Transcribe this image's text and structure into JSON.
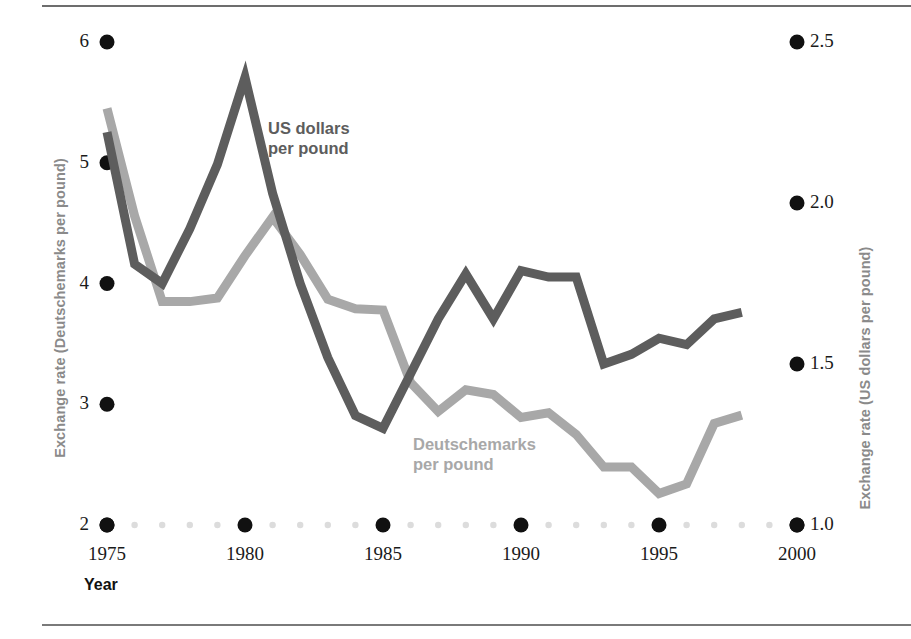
{
  "figure": {
    "background_color": "#ffffff",
    "rule_color": "#6d6d6d"
  },
  "axes": {
    "left": {
      "title": "Exchange rate (Deutschemarks per pound)",
      "ticks": [
        "6",
        "5",
        "4",
        "3",
        "2"
      ],
      "tick_values": [
        6,
        5,
        4,
        3,
        2
      ],
      "range": [
        2,
        6
      ],
      "color": "#8a8a8a"
    },
    "right": {
      "title": "Exchange rate (US dollars per pound)",
      "ticks": [
        "2.5",
        "2.0",
        "1.5",
        "1.0"
      ],
      "tick_values": [
        2.5,
        2.0,
        1.5,
        1.0
      ],
      "range": [
        1.0,
        2.5
      ],
      "color": "#8a8a8a"
    },
    "bottom": {
      "label": "Year",
      "ticks": [
        "1975",
        "1980",
        "1985",
        "1990",
        "1995",
        "2000"
      ],
      "tick_values": [
        1975,
        1980,
        1985,
        1990,
        1995,
        2000
      ],
      "range": [
        1975,
        2000
      ],
      "minor_tick_color": "#dcdcdc",
      "major_tick_color": "#111111"
    }
  },
  "annotations": {
    "usd_label": "US dollars\nper pound",
    "usd_label_color": "#5d5d5d",
    "dm_label": "Deutschemarks\nper pound",
    "dm_label_color": "#a8a8a8"
  },
  "chart_data": {
    "type": "line",
    "title": "",
    "xlabel": "Year",
    "ylabel": "Exchange rate (Deutschemarks per pound)",
    "y2label": "Exchange rate (US dollars per pound)",
    "xlim": [
      1975,
      2000
    ],
    "ylim": [
      2,
      6
    ],
    "y2lim": [
      1.0,
      2.5
    ],
    "grid": false,
    "legend": "inline-annotations",
    "x": [
      1975,
      1976,
      1977,
      1978,
      1979,
      1980,
      1981,
      1982,
      1983,
      1984,
      1985,
      1986,
      1987,
      1988,
      1989,
      1990,
      1991,
      1992,
      1993,
      1994,
      1995,
      1996,
      1997,
      1998
    ],
    "series": [
      {
        "name": "US dollars per pound",
        "axis": "right",
        "color": "#5d5d5d",
        "unit": "US dollars per pound",
        "values": [
          2.22,
          1.81,
          1.75,
          1.92,
          2.12,
          2.39,
          2.03,
          1.75,
          1.52,
          1.34,
          1.3,
          1.47,
          1.64,
          1.78,
          1.64,
          1.79,
          1.77,
          1.77,
          1.5,
          1.53,
          1.58,
          1.56,
          1.64,
          1.66
        ]
      },
      {
        "name": "Deutschemarks per pound",
        "axis": "left",
        "color": "#a8a8a8",
        "unit": "Deutschemarks per pound",
        "values": [
          5.45,
          4.56,
          3.85,
          3.85,
          3.88,
          4.23,
          4.55,
          4.24,
          3.87,
          3.79,
          3.78,
          3.18,
          2.94,
          3.12,
          3.08,
          2.89,
          2.93,
          2.75,
          2.48,
          2.48,
          2.26,
          2.34,
          2.84,
          2.91
        ]
      }
    ]
  }
}
